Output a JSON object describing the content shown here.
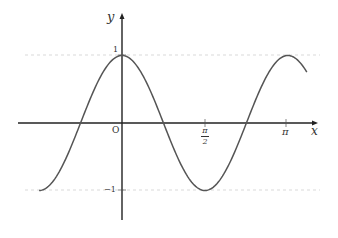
{
  "chart_data": {
    "type": "line",
    "title": "",
    "function": "y = cos(2x)",
    "xlabel": "x",
    "ylabel": "y",
    "origin_label": "O",
    "x_ticks": [
      {
        "value": 1.5708,
        "label": "π/2",
        "num": "π",
        "den": "2"
      },
      {
        "value": 3.1416,
        "label": "π"
      }
    ],
    "y_ticks": [
      {
        "value": 1,
        "label": "1"
      },
      {
        "value": -1,
        "label": "−1"
      }
    ],
    "xlim": [
      -1.57,
      3.5
    ],
    "ylim": [
      -1,
      1
    ],
    "reference_lines": [
      {
        "y": 1,
        "style": "dashed"
      },
      {
        "y": -1,
        "style": "dashed"
      }
    ],
    "series": [
      {
        "name": "cos(2x)",
        "x": [
          -1.5708,
          -0.7854,
          0,
          0.7854,
          1.5708,
          2.3562,
          3.1416,
          3.47
        ],
        "y": [
          -1,
          0,
          1,
          0,
          -1,
          0,
          1,
          0.79
        ]
      }
    ],
    "grid": false,
    "legend": null,
    "colors": {
      "curve": "#555555",
      "axis": "#222222",
      "dash": "#cccccc"
    }
  }
}
